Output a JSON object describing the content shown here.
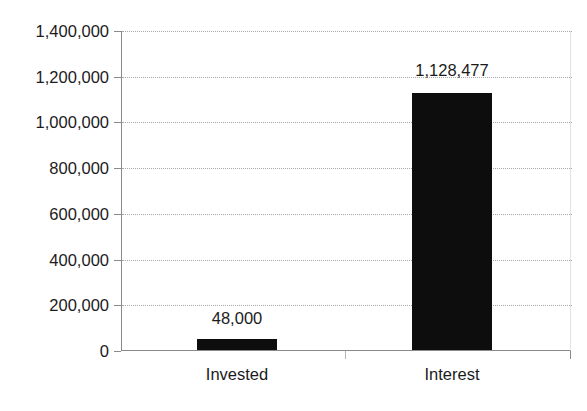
{
  "chart_data": {
    "type": "bar",
    "title": "",
    "subtitle": "",
    "xlabel": "",
    "ylabel": "",
    "categories": [
      "Invested",
      "Interest"
    ],
    "values": [
      48000,
      1128477
    ],
    "data_labels": [
      "48,000",
      "1,128,477"
    ],
    "ylim": [
      0,
      1400000
    ],
    "ytick_values": [
      1400000,
      1200000,
      1000000,
      800000,
      600000,
      400000,
      200000,
      0
    ],
    "ytick_labels": [
      "1,400,000",
      "1,200,000",
      "1,000,000",
      "800,000",
      "600,000",
      "400,000",
      "200,000",
      "0"
    ],
    "grid": true,
    "grid_axis": "y",
    "legend": false,
    "legend_position": "none",
    "series": [
      {
        "name": "",
        "values": [
          48000,
          1128477
        ],
        "color": "#0d0d0d"
      }
    ],
    "colors": {
      "bar": "#0d0d0d",
      "axis": "#8a8a8a",
      "grid": "#9a9a9a",
      "text": "#1b1b1b",
      "background": "#ffffff"
    }
  }
}
